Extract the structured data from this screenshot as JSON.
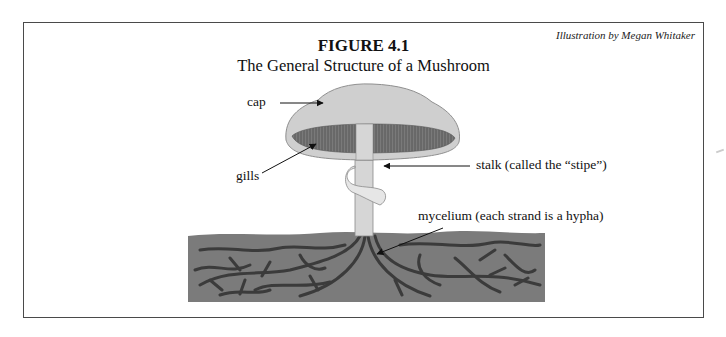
{
  "figure": {
    "credit": "Illustration by Megan Whitaker",
    "number": "FIGURE 4.1",
    "title": "The General Structure of a Mushroom"
  },
  "labels": {
    "cap": "cap",
    "gills": "gills",
    "stalk": "stalk (called the “stipe”)",
    "mycelium": "mycelium (each strand is a hypha)"
  },
  "colors": {
    "cap": "#cfcfcf",
    "gills": "#6e6e6e",
    "stalk": "#d6d6d6",
    "soil": "#7a7a7a",
    "hyphae": "#3a3a3a",
    "frame": "#4a4a4a"
  }
}
